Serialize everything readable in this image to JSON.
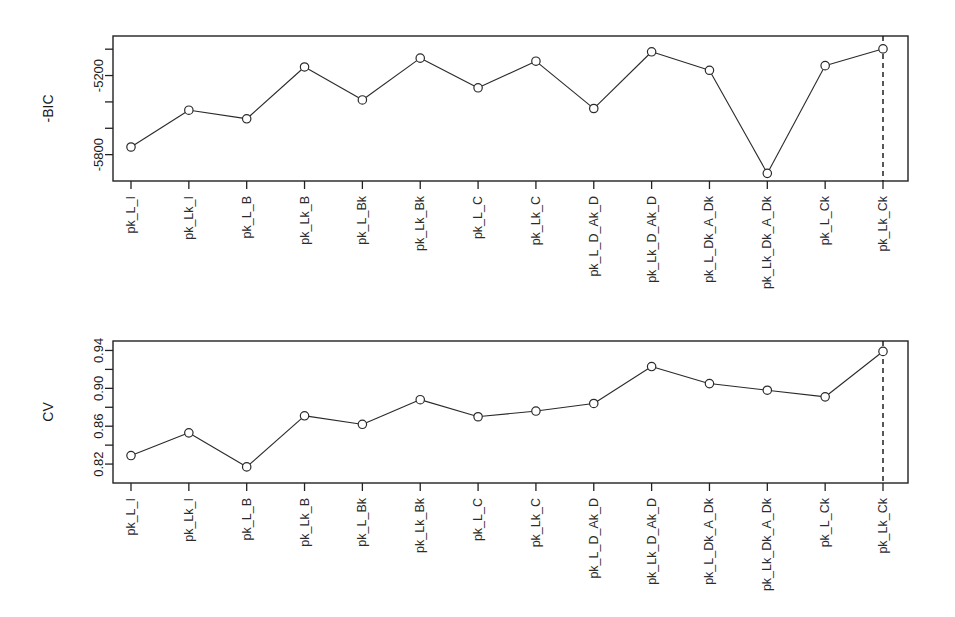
{
  "figure": {
    "title": "",
    "background_color": "#ffffff",
    "line_color": "#2a2a2a",
    "point_fill_color": "#ffffff",
    "reference_line_color": "#111111"
  },
  "chart_data": [
    {
      "id": "bic-panel",
      "type": "line",
      "title": "",
      "xlabel": "",
      "ylabel": "-BIC",
      "grid": false,
      "legend": null,
      "ylim": [
        -6000,
        -4900
      ],
      "ytick_values": [
        -5000,
        -5200,
        -5400,
        -5600,
        -5800
      ],
      "ytick_labels": [
        "",
        "-5200",
        "",
        "",
        "-5800"
      ],
      "categories": [
        "pk_L_I",
        "pk_Lk_I",
        "pk_L_B",
        "pk_Lk_B",
        "pk_L_Bk",
        "pk_Lk_Bk",
        "pk_L_C",
        "pk_Lk_C",
        "pk_L_D_Ak_D",
        "pk_Lk_D_Ak_D",
        "pk_L_Dk_A_Dk",
        "pk_Lk_Dk_A_Dk",
        "pk_L_Ck",
        "pk_Lk_Ck"
      ],
      "values": [
        -5742,
        -5463,
        -5528,
        -5135,
        -5385,
        -5068,
        -5293,
        -5091,
        -5450,
        -5020,
        -5160,
        -5942,
        -5125,
        -4998
      ],
      "reference_line": {
        "orientation": "vertical",
        "at_category": "pk_Lk_Ck",
        "style": "dashed"
      },
      "best_model": "pk_Lk_Ck"
    },
    {
      "id": "cv-panel",
      "type": "line",
      "title": "",
      "xlabel": "",
      "ylabel": "CV",
      "grid": false,
      "legend": null,
      "ylim": [
        0.8,
        0.95
      ],
      "ytick_values": [
        0.94,
        0.92,
        0.9,
        0.88,
        0.86,
        0.84,
        0.82
      ],
      "ytick_labels": [
        "0.94",
        "",
        "0.90",
        "",
        "0.86",
        "",
        "0.82"
      ],
      "categories": [
        "pk_L_I",
        "pk_Lk_I",
        "pk_L_B",
        "pk_Lk_B",
        "pk_L_Bk",
        "pk_Lk_Bk",
        "pk_L_C",
        "pk_Lk_C",
        "pk_L_D_Ak_D",
        "pk_Lk_D_Ak_D",
        "pk_L_Dk_A_Dk",
        "pk_Lk_Dk_A_Dk",
        "pk_L_Ck",
        "pk_Lk_Ck"
      ],
      "values": [
        0.829,
        0.853,
        0.817,
        0.871,
        0.862,
        0.888,
        0.87,
        0.876,
        0.884,
        0.923,
        0.905,
        0.898,
        0.891,
        0.939
      ],
      "reference_line": {
        "orientation": "vertical",
        "at_category": "pk_Lk_Ck",
        "style": "dashed"
      },
      "best_model": "pk_Lk_Ck"
    }
  ]
}
